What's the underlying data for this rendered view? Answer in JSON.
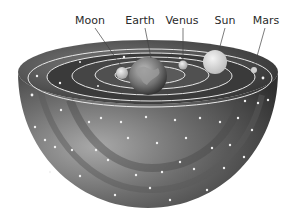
{
  "diagram": {
    "labels": [
      {
        "id": "moon",
        "text": "Moon",
        "x": 90
      },
      {
        "id": "earth",
        "text": "Earth",
        "x": 140
      },
      {
        "id": "venus",
        "text": "Venus",
        "x": 182
      },
      {
        "id": "sun",
        "text": "Sun",
        "x": 225
      },
      {
        "id": "mars",
        "text": "Mars",
        "x": 266
      }
    ],
    "colors": {
      "background": "#ffffff",
      "shell_dark": "#2e2e2e",
      "shell_mid": "#6a6a6a",
      "shell_light": "#a8a8a8",
      "orbit_line": "#e6e6e6",
      "star": "#f2f2f2",
      "label_text": "#2a2a2a"
    }
  }
}
